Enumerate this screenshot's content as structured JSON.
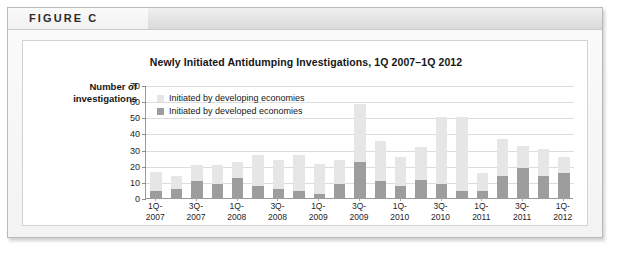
{
  "figure": {
    "label": "FIGURE C"
  },
  "chart_data": {
    "type": "bar",
    "subtype": "stacked-bar",
    "title": "Newly Initiated Antidumping Investigations, 1Q 2007–1Q 2012",
    "xlabel": "",
    "ylabel": "Number of investigations",
    "ylim": [
      0,
      70
    ],
    "yticks": [
      0,
      10,
      20,
      30,
      40,
      50,
      60,
      70
    ],
    "ytick_labels": [
      "0",
      "10",
      "20",
      "30",
      "40",
      "50",
      "60",
      "70"
    ],
    "grid": true,
    "legend_position": "upper-left-inside",
    "categories": [
      "1Q-2007",
      "2Q-2007",
      "3Q-2007",
      "4Q-2007",
      "1Q-2008",
      "2Q-2008",
      "3Q-2008",
      "4Q-2008",
      "1Q-2009",
      "2Q-2009",
      "3Q-2009",
      "4Q-2009",
      "1Q-2010",
      "2Q-2010",
      "3Q-2010",
      "4Q-2010",
      "1Q-2011",
      "2Q-2011",
      "3Q-2011",
      "4Q-2011",
      "1Q-2012"
    ],
    "xtick_labels": [
      "1Q-\n2007",
      "",
      "3Q-\n2007",
      "",
      "1Q-\n2008",
      "",
      "3Q-\n2008",
      "",
      "1Q-\n2009",
      "",
      "3Q-\n2009",
      "",
      "1Q-\n2010",
      "",
      "3Q-\n2010",
      "",
      "1Q-\n2011",
      "",
      "3Q-\n2011",
      "",
      "1Q-\n2012"
    ],
    "xtick_lines": [
      [
        "1Q-",
        "2007"
      ],
      [
        "3Q-",
        "2007"
      ],
      [
        "1Q-",
        "2008"
      ],
      [
        "3Q-",
        "2008"
      ],
      [
        "1Q-",
        "2009"
      ],
      [
        "3Q-",
        "2009"
      ],
      [
        "1Q-",
        "2010"
      ],
      [
        "3Q-",
        "2010"
      ],
      [
        "1Q-",
        "2011"
      ],
      [
        "3Q-",
        "2011"
      ],
      [
        "1Q-",
        "2012"
      ]
    ],
    "series": [
      {
        "name": "Initiated by developed economies",
        "color": "#9d9d9d",
        "values": [
          5,
          6,
          11,
          9,
          13,
          8,
          6,
          5,
          3,
          9,
          23,
          11,
          8,
          12,
          9,
          5,
          5,
          14,
          19,
          14,
          16
        ]
      },
      {
        "name": "Initiated by developing economies",
        "color": "#e6e6e6",
        "values": [
          12,
          8,
          10,
          12,
          10,
          19,
          18,
          22,
          19,
          15,
          36,
          25,
          18,
          20,
          42,
          46,
          11,
          23,
          14,
          17,
          10
        ]
      }
    ],
    "totals": [
      17,
      14,
      21,
      21,
      23,
      27,
      24,
      27,
      22,
      24,
      59,
      36,
      26,
      32,
      51,
      51,
      16,
      37,
      33,
      31,
      26
    ]
  },
  "legend": {
    "items": [
      {
        "label": "Initiated by developing economies",
        "color": "#e6e6e6"
      },
      {
        "label": "Initiated by developed economies",
        "color": "#9d9d9d"
      }
    ]
  },
  "axis_title": {
    "line1": "Number of",
    "line2": "investigations"
  }
}
